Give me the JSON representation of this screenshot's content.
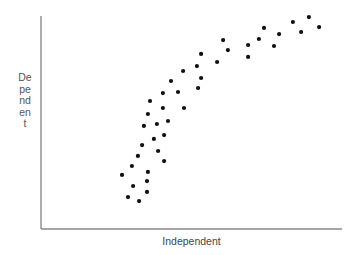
{
  "chart_data": {
    "type": "scatter",
    "title": "",
    "xlabel": "Independent",
    "ylabel": "Dependent",
    "xlim": [
      0,
      100
    ],
    "ylim": [
      0,
      100
    ],
    "grid": false,
    "legend": null,
    "axis_ticks": false,
    "colors": {
      "points": "#111111",
      "axes": "#8a8a8a",
      "label": "#555555"
    },
    "series": [
      {
        "name": "observations",
        "points": [
          [
            28.9,
            15.0
          ],
          [
            32.6,
            13.1
          ],
          [
            26.9,
            25.4
          ],
          [
            30.6,
            20.2
          ],
          [
            35.2,
            17.4
          ],
          [
            30.2,
            29.6
          ],
          [
            35.2,
            22.5
          ],
          [
            35.5,
            26.8
          ],
          [
            32.2,
            34.3
          ],
          [
            33.6,
            39.4
          ],
          [
            40.9,
            31.9
          ],
          [
            38.9,
            36.6
          ],
          [
            40.9,
            44.1
          ],
          [
            37.5,
            42.3
          ],
          [
            34.2,
            48.4
          ],
          [
            38.5,
            49.3
          ],
          [
            42.2,
            50.7
          ],
          [
            35.5,
            54.0
          ],
          [
            36.2,
            60.1
          ],
          [
            40.5,
            56.8
          ],
          [
            47.5,
            56.8
          ],
          [
            40.5,
            63.8
          ],
          [
            45.5,
            64.3
          ],
          [
            43.2,
            69.5
          ],
          [
            47.2,
            74.2
          ],
          [
            52.2,
            66.2
          ],
          [
            53.2,
            70.9
          ],
          [
            51.8,
            76.5
          ],
          [
            53.2,
            82.2
          ],
          [
            58.5,
            78.4
          ],
          [
            60.5,
            88.7
          ],
          [
            62.1,
            84.0
          ],
          [
            68.8,
            86.4
          ],
          [
            68.8,
            80.8
          ],
          [
            72.4,
            89.2
          ],
          [
            74.1,
            94.4
          ],
          [
            77.4,
            85.9
          ],
          [
            79.1,
            91.5
          ],
          [
            83.7,
            97.2
          ],
          [
            86.4,
            92.5
          ],
          [
            89.0,
            99.5
          ],
          [
            92.4,
            94.8
          ]
        ]
      }
    ]
  },
  "labels": {
    "x_axis": "Independent",
    "y_axis": "Dependent"
  }
}
